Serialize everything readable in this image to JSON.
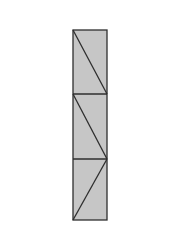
{
  "diagram": {
    "type": "rectangle-strip-with-diagonals",
    "canvas": {
      "width": 182,
      "height": 245,
      "background": "#ffffff"
    },
    "fill_color": "#c6c6c6",
    "stroke_color": "#2e2e2e",
    "stroke_width": 1.3,
    "outer_rect": {
      "x": 73,
      "y": 30,
      "width": 34,
      "height": 190
    },
    "dividers_y": [
      94,
      159
    ],
    "diagonals": [
      {
        "x1": 73,
        "y1": 30,
        "x2": 107,
        "y2": 94
      },
      {
        "x1": 73,
        "y1": 94,
        "x2": 107,
        "y2": 159
      },
      {
        "x1": 107,
        "y1": 159,
        "x2": 73,
        "y2": 220
      }
    ]
  }
}
